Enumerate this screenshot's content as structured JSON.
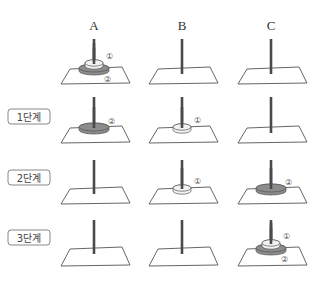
{
  "diagram": {
    "type": "tower-of-hanoi-steps",
    "columns": [
      {
        "label": "A",
        "cx": 94
      },
      {
        "label": "B",
        "cx": 182
      },
      {
        "label": "C",
        "cx": 271
      }
    ],
    "rows": [
      {
        "stage_label": "",
        "y_rod_top": 39,
        "y_plat_top": 68,
        "y_plat_bottom": 83,
        "pegs": [
          {
            "column": "A",
            "disks_bottom_to_top": [
              "2",
              "1"
            ]
          },
          {
            "column": "B",
            "disks_bottom_to_top": []
          },
          {
            "column": "C",
            "disks_bottom_to_top": []
          }
        ]
      },
      {
        "stage_label": "1단계",
        "y_rod_top": 97,
        "y_plat_top": 127,
        "y_plat_bottom": 142,
        "pegs": [
          {
            "column": "A",
            "disks_bottom_to_top": [
              "2"
            ]
          },
          {
            "column": "B",
            "disks_bottom_to_top": [
              "1"
            ]
          },
          {
            "column": "C",
            "disks_bottom_to_top": []
          }
        ]
      },
      {
        "stage_label": "2단계",
        "y_rod_top": 160,
        "y_plat_top": 188,
        "y_plat_bottom": 203,
        "pegs": [
          {
            "column": "A",
            "disks_bottom_to_top": []
          },
          {
            "column": "B",
            "disks_bottom_to_top": [
              "1"
            ]
          },
          {
            "column": "C",
            "disks_bottom_to_top": [
              "2"
            ]
          }
        ]
      },
      {
        "stage_label": "3단계",
        "y_rod_top": 220,
        "y_plat_top": 248,
        "y_plat_bottom": 265,
        "pegs": [
          {
            "column": "A",
            "disks_bottom_to_top": []
          },
          {
            "column": "B",
            "disks_bottom_to_top": []
          },
          {
            "column": "C",
            "disks_bottom_to_top": [
              "2",
              "1"
            ]
          }
        ]
      }
    ],
    "disk_labels": {
      "1": "①",
      "2": "②"
    },
    "colors": {
      "rod": "#4a4a4a",
      "platform_stroke": "#555555",
      "disk_small_fill": "#f2f2f2",
      "disk_large_fill": "#8c8c8c",
      "disk_stroke": "#555555",
      "stage_box_stroke": "#888888"
    }
  }
}
